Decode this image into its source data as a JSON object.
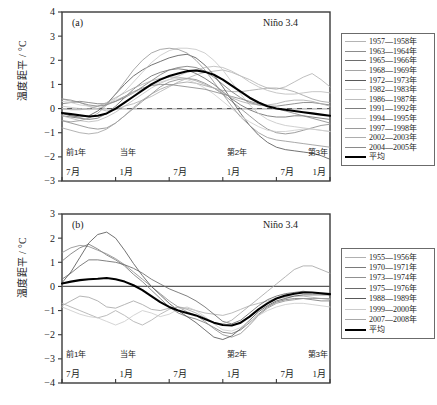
{
  "figure": {
    "axis_ylabel": "温度距平 / °C",
    "region_label": "Niño 3.4",
    "background": "#ffffff",
    "mean_color": "#000000",
    "frame_color": "#3a3a3a"
  },
  "panels": [
    {
      "tag": "(a)",
      "region_label": "Niño 3.4",
      "axis_ylabel": "温度距平 / °C",
      "yticks": [
        "4",
        "3",
        "2",
        "1",
        "0",
        "-1",
        "-2",
        "-3"
      ],
      "year_labels": [
        "前1年",
        "当年",
        "第2年",
        "第3年"
      ],
      "month_labels": [
        "7月",
        "1月",
        "7月",
        "1月",
        "7月",
        "1月"
      ],
      "legend": [
        {
          "label": "1957—1958年",
          "color": "#b4b4b4",
          "width": 0.8
        },
        {
          "label": "1963—1964年",
          "color": "#8c8c8c",
          "width": 0.8
        },
        {
          "label": "1965—1966年",
          "color": "#6e6e6e",
          "width": 0.9
        },
        {
          "label": "1968—1969年",
          "color": "#a5a5a5",
          "width": 0.8
        },
        {
          "label": "1972—1973年",
          "color": "#5a5a5a",
          "width": 0.9
        },
        {
          "label": "1982—1983年",
          "color": "#c8c8c8",
          "width": 0.8
        },
        {
          "label": "1986—1987年",
          "color": "#bdbdbd",
          "width": 0.8
        },
        {
          "label": "1991—1992年",
          "color": "#7d7d7d",
          "width": 0.8
        },
        {
          "label": "1994—1995年",
          "color": "#cfcfcf",
          "width": 0.8
        },
        {
          "label": "1997—1998年",
          "color": "#9a9a9a",
          "width": 0.8
        },
        {
          "label": "2002—2003年",
          "color": "#adadad",
          "width": 0.8
        },
        {
          "label": "2004—2005年",
          "color": "#8a8a8a",
          "width": 0.8
        },
        {
          "label": "平均",
          "color": "#000000",
          "width": 2.1
        }
      ]
    },
    {
      "tag": "(b)",
      "region_label": "Niño 3.4",
      "axis_ylabel": "温度距平 / °C",
      "yticks": [
        "3",
        "2",
        "1",
        "0",
        "-1",
        "-2",
        "-3",
        "-4"
      ],
      "year_labels": [
        "前1年",
        "当年",
        "第2年",
        "第3年"
      ],
      "month_labels": [
        "7月",
        "1月",
        "7月",
        "1月",
        "7月",
        "1月"
      ],
      "legend": [
        {
          "label": "1955—1956年",
          "color": "#b0b0b0",
          "width": 0.8
        },
        {
          "label": "1970—1971年",
          "color": "#7a7a7a",
          "width": 0.9
        },
        {
          "label": "1973—1974年",
          "color": "#909090",
          "width": 0.8
        },
        {
          "label": "1975—1976年",
          "color": "#6a6a6a",
          "width": 0.9
        },
        {
          "label": "1988—1989年",
          "color": "#585858",
          "width": 0.9
        },
        {
          "label": "1999—2000年",
          "color": "#cccccc",
          "width": 0.8
        },
        {
          "label": "2007—2008年",
          "color": "#a8a8a8",
          "width": 0.8
        },
        {
          "label": "平均",
          "color": "#000000",
          "width": 2.1
        }
      ]
    }
  ],
  "chart_data": [
    {
      "type": "line",
      "panel": "(a)",
      "title": "Niño 3.4",
      "subtitle": "El Niño event composites",
      "xlabel": "",
      "ylabel": "温度距平 / °C",
      "ylim": [
        -3,
        4
      ],
      "xlim": [
        0,
        30
      ],
      "grid": false,
      "zero_line": true,
      "legend_position": "right",
      "x_tick_positions": [
        0,
        6,
        12,
        18,
        24,
        30
      ],
      "x_tick_labels": [
        "7月",
        "1月",
        "7月",
        "1月",
        "7月",
        "1月"
      ],
      "x_year_positions": [
        0,
        6,
        18,
        30
      ],
      "x_year_labels": [
        "前1年",
        "当年",
        "第2年",
        "第3年"
      ],
      "x_months": [
        0,
        1,
        2,
        3,
        4,
        5,
        6,
        7,
        8,
        9,
        10,
        11,
        12,
        13,
        14,
        15,
        16,
        17,
        18,
        19,
        20,
        21,
        22,
        23,
        24,
        25,
        26,
        27,
        28,
        29,
        30
      ],
      "series": [
        {
          "name": "1957—1958年",
          "color": "#b4b4b4",
          "values": [
            0.4,
            0.3,
            0.25,
            0.1,
            0.0,
            -0.1,
            -0.05,
            0.1,
            0.2,
            0.35,
            0.5,
            0.7,
            0.9,
            1.1,
            1.25,
            1.4,
            1.5,
            1.55,
            1.6,
            1.5,
            1.35,
            1.2,
            1.0,
            0.85,
            0.8,
            0.9,
            1.1,
            1.3,
            1.45,
            1.2,
            0.9
          ]
        },
        {
          "name": "1963—1964年",
          "color": "#8c8c8c",
          "values": [
            -0.5,
            -0.6,
            -0.7,
            -0.8,
            -0.85,
            -0.8,
            -0.6,
            -0.3,
            0.0,
            0.3,
            0.6,
            0.9,
            1.1,
            1.2,
            1.25,
            1.2,
            1.05,
            0.85,
            0.6,
            0.3,
            0.0,
            -0.3,
            -0.6,
            -0.85,
            -1.0,
            -1.05,
            -1.0,
            -0.9,
            -0.8,
            -0.7,
            -0.65
          ]
        },
        {
          "name": "1965—1966年",
          "color": "#6e6e6e",
          "values": [
            -0.3,
            -0.35,
            -0.4,
            -0.45,
            -0.4,
            -0.2,
            0.1,
            0.45,
            0.8,
            1.1,
            1.35,
            1.5,
            1.6,
            1.65,
            1.6,
            1.45,
            1.25,
            1.0,
            0.7,
            0.4,
            0.15,
            -0.05,
            -0.2,
            -0.3,
            -0.35,
            -0.35,
            -0.3,
            -0.3,
            -0.35,
            -0.4,
            -0.45
          ]
        },
        {
          "name": "1968—1969年",
          "color": "#a5a5a5",
          "values": [
            -0.8,
            -0.9,
            -1.0,
            -1.05,
            -1.0,
            -0.85,
            -0.6,
            -0.3,
            0.05,
            0.35,
            0.6,
            0.8,
            0.95,
            1.05,
            1.1,
            1.05,
            0.95,
            0.85,
            0.75,
            0.7,
            0.7,
            0.75,
            0.8,
            0.85,
            0.85,
            0.8,
            0.7,
            0.55,
            0.4,
            0.3,
            0.25
          ]
        },
        {
          "name": "1972—1973年",
          "color": "#5a5a5a",
          "values": [
            -0.2,
            -0.3,
            -0.35,
            -0.3,
            -0.1,
            0.2,
            0.6,
            1.0,
            1.35,
            1.6,
            1.8,
            1.95,
            2.1,
            2.2,
            2.25,
            2.1,
            1.8,
            1.4,
            0.9,
            0.35,
            -0.2,
            -0.7,
            -1.1,
            -1.4,
            -1.6,
            -1.7,
            -1.75,
            -1.8,
            -1.85,
            -1.95,
            -2.1
          ]
        },
        {
          "name": "1982—1983年",
          "color": "#c8c8c8",
          "values": [
            0.1,
            0.05,
            0.0,
            -0.05,
            0.0,
            0.15,
            0.4,
            0.7,
            1.1,
            1.5,
            1.9,
            2.2,
            2.4,
            2.5,
            2.5,
            2.45,
            2.3,
            2.0,
            1.6,
            1.1,
            0.6,
            0.15,
            -0.2,
            -0.45,
            -0.6,
            -0.7,
            -0.75,
            -0.8,
            -0.85,
            -0.9,
            -0.95
          ]
        },
        {
          "name": "1986—1987年",
          "color": "#bdbdbd",
          "values": [
            -0.3,
            -0.4,
            -0.5,
            -0.55,
            -0.5,
            -0.35,
            -0.15,
            0.1,
            0.35,
            0.6,
            0.85,
            1.05,
            1.2,
            1.35,
            1.5,
            1.6,
            1.7,
            1.75,
            1.7,
            1.55,
            1.35,
            1.1,
            0.9,
            0.75,
            0.65,
            0.6,
            0.6,
            0.65,
            0.7,
            0.7,
            0.65
          ]
        },
        {
          "name": "1991—1992年",
          "color": "#7d7d7d",
          "values": [
            0.2,
            0.25,
            0.3,
            0.25,
            0.2,
            0.2,
            0.3,
            0.45,
            0.65,
            0.9,
            1.15,
            1.4,
            1.6,
            1.7,
            1.75,
            1.7,
            1.55,
            1.3,
            1.0,
            0.7,
            0.45,
            0.25,
            0.15,
            0.1,
            0.1,
            0.15,
            0.2,
            0.25,
            0.25,
            0.2,
            0.15
          ]
        },
        {
          "name": "1994—1995年",
          "color": "#cfcfcf",
          "values": [
            0.3,
            0.25,
            0.15,
            0.1,
            0.1,
            0.2,
            0.35,
            0.5,
            0.65,
            0.8,
            0.95,
            1.1,
            1.2,
            1.25,
            1.2,
            1.05,
            0.85,
            0.6,
            0.3,
            0.0,
            -0.3,
            -0.55,
            -0.75,
            -0.9,
            -0.95,
            -0.95,
            -0.9,
            -0.85,
            -0.85,
            -0.9,
            -0.95
          ]
        },
        {
          "name": "1997—1998年",
          "color": "#9a9a9a",
          "values": [
            -0.5,
            -0.55,
            -0.5,
            -0.4,
            -0.2,
            0.15,
            0.6,
            1.1,
            1.6,
            2.0,
            2.3,
            2.45,
            2.5,
            2.45,
            2.3,
            2.0,
            1.6,
            1.1,
            0.6,
            0.1,
            -0.35,
            -0.7,
            -1.0,
            -1.2,
            -1.3,
            -1.35,
            -1.4,
            -1.45,
            -1.5,
            -1.55,
            -1.6
          ]
        },
        {
          "name": "2002—2003年",
          "color": "#adadad",
          "values": [
            0.0,
            -0.05,
            -0.05,
            0.0,
            0.1,
            0.25,
            0.45,
            0.65,
            0.85,
            1.0,
            1.15,
            1.25,
            1.3,
            1.3,
            1.25,
            1.15,
            1.0,
            0.85,
            0.65,
            0.45,
            0.3,
            0.2,
            0.15,
            0.15,
            0.2,
            0.3,
            0.35,
            0.35,
            0.3,
            0.2,
            0.1
          ]
        },
        {
          "name": "2004—2005年",
          "color": "#8a8a8a",
          "values": [
            0.4,
            0.35,
            0.25,
            0.15,
            0.1,
            0.15,
            0.3,
            0.5,
            0.7,
            0.85,
            0.95,
            1.0,
            1.0,
            0.95,
            0.9,
            0.85,
            0.8,
            0.7,
            0.6,
            0.5,
            0.4,
            0.3,
            0.2,
            0.1,
            0.0,
            -0.1,
            -0.2,
            -0.3,
            -0.4,
            -0.5,
            -0.6
          ]
        },
        {
          "name": "平均",
          "color": "#000000",
          "is_mean": true,
          "values": [
            -0.18,
            -0.23,
            -0.28,
            -0.33,
            -0.3,
            -0.2,
            0.0,
            0.25,
            0.5,
            0.75,
            1.0,
            1.2,
            1.35,
            1.45,
            1.55,
            1.58,
            1.52,
            1.4,
            1.2,
            0.95,
            0.7,
            0.45,
            0.25,
            0.1,
            0.0,
            -0.05,
            -0.1,
            -0.15,
            -0.2,
            -0.25,
            -0.3
          ]
        }
      ]
    },
    {
      "type": "line",
      "panel": "(b)",
      "title": "Niño 3.4",
      "subtitle": "La Niña event composites",
      "xlabel": "",
      "ylabel": "温度距平 / °C",
      "ylim": [
        -4,
        3
      ],
      "xlim": [
        0,
        30
      ],
      "grid": false,
      "zero_line": true,
      "legend_position": "right",
      "x_tick_positions": [
        0,
        6,
        12,
        18,
        24,
        30
      ],
      "x_tick_labels": [
        "7月",
        "1月",
        "7月",
        "1月",
        "7月",
        "1月"
      ],
      "x_year_positions": [
        0,
        6,
        18,
        30
      ],
      "x_year_labels": [
        "前1年",
        "当年",
        "第2年",
        "第3年"
      ],
      "x_months": [
        0,
        1,
        2,
        3,
        4,
        5,
        6,
        7,
        8,
        9,
        10,
        11,
        12,
        13,
        14,
        15,
        16,
        17,
        18,
        19,
        20,
        21,
        22,
        23,
        24,
        25,
        26,
        27,
        28,
        29,
        30
      ],
      "series": [
        {
          "name": "1955—1956年",
          "color": "#b0b0b0",
          "values": [
            -0.7,
            -0.85,
            -1.0,
            -1.15,
            -1.3,
            -1.2,
            -1.0,
            -1.2,
            -1.45,
            -1.6,
            -1.4,
            -1.15,
            -0.95,
            -0.85,
            -0.9,
            -1.0,
            -1.1,
            -1.15,
            -1.2,
            -1.1,
            -0.95,
            -0.8,
            -0.7,
            -0.6,
            -0.5,
            -0.45,
            -0.4,
            -0.4,
            -0.45,
            -0.5,
            -0.55
          ]
        },
        {
          "name": "1970—1971年",
          "color": "#7a7a7a",
          "values": [
            1.05,
            1.35,
            1.6,
            1.75,
            1.55,
            1.3,
            1.1,
            0.85,
            0.5,
            0.2,
            -0.15,
            -0.5,
            -0.85,
            -1.1,
            -1.25,
            -1.35,
            -1.5,
            -1.7,
            -1.9,
            -1.95,
            -1.8,
            -1.5,
            -1.15,
            -0.85,
            -0.65,
            -0.55,
            -0.5,
            -0.5,
            -0.55,
            -0.6,
            -0.6
          ]
        },
        {
          "name": "1973—1974年",
          "color": "#909090",
          "values": [
            1.4,
            1.6,
            1.7,
            1.65,
            1.5,
            1.35,
            1.15,
            0.9,
            0.6,
            0.3,
            0.0,
            -0.3,
            -0.6,
            -0.85,
            -1.05,
            -1.2,
            -1.45,
            -1.75,
            -2.0,
            -2.1,
            -1.95,
            -1.6,
            -1.2,
            -0.9,
            -0.7,
            -0.6,
            -0.55,
            -0.5,
            -0.5,
            -0.5,
            -0.5
          ]
        },
        {
          "name": "1975—1976年",
          "color": "#6a6a6a",
          "values": [
            0.3,
            0.55,
            0.85,
            1.1,
            1.1,
            1.05,
            1.0,
            0.9,
            0.75,
            0.55,
            0.3,
            0.1,
            -0.1,
            -0.25,
            -0.4,
            -0.6,
            -0.85,
            -1.15,
            -1.45,
            -1.55,
            -1.4,
            -1.1,
            -0.8,
            -0.55,
            -0.4,
            -0.3,
            -0.25,
            -0.2,
            -0.25,
            -0.3,
            -0.35
          ]
        },
        {
          "name": "1988—1989年",
          "color": "#585858",
          "values": [
            0.15,
            0.6,
            1.2,
            1.8,
            2.15,
            2.25,
            2.0,
            1.5,
            0.95,
            0.45,
            0.0,
            -0.35,
            -0.7,
            -1.0,
            -1.25,
            -1.5,
            -1.8,
            -2.1,
            -2.2,
            -2.05,
            -1.75,
            -1.4,
            -1.05,
            -0.8,
            -0.6,
            -0.5,
            -0.4,
            -0.35,
            -0.35,
            -0.35,
            -0.35
          ]
        },
        {
          "name": "1999—2000年",
          "color": "#cccccc",
          "values": [
            -0.85,
            -1.0,
            -1.15,
            -1.25,
            -1.3,
            -1.45,
            -1.6,
            -1.45,
            -1.2,
            -1.0,
            -1.1,
            -1.25,
            -1.15,
            -0.95,
            -0.85,
            -1.0,
            -1.25,
            -1.55,
            -1.8,
            -1.85,
            -1.7,
            -1.45,
            -1.2,
            -1.0,
            -0.85,
            -0.75,
            -0.7,
            -0.7,
            -0.75,
            -0.8,
            -0.85
          ]
        },
        {
          "name": "2007—2008年",
          "color": "#a8a8a8",
          "values": [
            -0.8,
            -0.6,
            -0.4,
            -0.45,
            -0.6,
            -0.85,
            -0.9,
            -0.75,
            -0.6,
            -0.75,
            -0.95,
            -1.0,
            -0.9,
            -0.85,
            -0.95,
            -1.1,
            -1.3,
            -1.5,
            -1.55,
            -1.4,
            -1.1,
            -0.8,
            -0.5,
            -0.2,
            0.1,
            0.4,
            0.7,
            0.85,
            0.85,
            0.7,
            0.55
          ]
        },
        {
          "name": "平均",
          "color": "#000000",
          "is_mean": true,
          "values": [
            0.12,
            0.2,
            0.26,
            0.3,
            0.32,
            0.35,
            0.3,
            0.2,
            0.05,
            -0.15,
            -0.4,
            -0.65,
            -0.85,
            -1.0,
            -1.1,
            -1.2,
            -1.35,
            -1.5,
            -1.6,
            -1.62,
            -1.5,
            -1.25,
            -0.95,
            -0.7,
            -0.5,
            -0.38,
            -0.3,
            -0.25,
            -0.25,
            -0.28,
            -0.32
          ]
        }
      ]
    }
  ]
}
